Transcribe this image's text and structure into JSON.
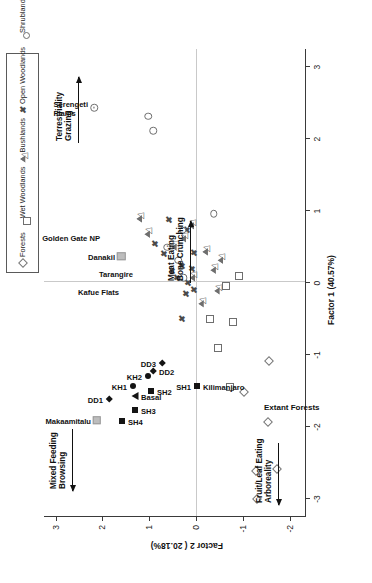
{
  "figure": {
    "type": "scatter-biplot",
    "orientation": "rotated-90"
  },
  "legend": {
    "items": [
      {
        "label": "Forests",
        "marker": "open-diamond"
      },
      {
        "label": "Wet Woodlands",
        "marker": "open-square"
      },
      {
        "label": "Bushlands",
        "marker": "open-triangle"
      },
      {
        "label": "Open Woodlands",
        "marker": "x-cross"
      },
      {
        "label": "Shrublands",
        "marker": "open-circle"
      },
      {
        "label": "Grasslands",
        "marker": "circle-dot"
      },
      {
        "label": "Grass/Forest",
        "marker": "open-triangle"
      },
      {
        "label": "Basal",
        "marker": "filled-triangle"
      },
      {
        "label": "Sidi Hakoma",
        "marker": "filled-square"
      },
      {
        "label": "Denen Dora",
        "marker": "filled-diamond"
      },
      {
        "label": "Kada Hadar",
        "marker": "filled-circle"
      },
      {
        "label": "Other",
        "marker": "grey-square"
      }
    ]
  },
  "axes": {
    "x": {
      "label": "Factor 1 (40.57%)",
      "ticks": [
        -3,
        -2,
        -1,
        0,
        1,
        2,
        3
      ],
      "tick_labels": [
        "-3",
        "-2",
        "-1",
        "0",
        "1",
        "2",
        "3"
      ],
      "min": -3.25,
      "max": 3.25
    },
    "y": {
      "label": "Factor 2 ( 20.18%)",
      "ticks": [
        -2,
        -1,
        0,
        1,
        2,
        3
      ],
      "tick_labels": [
        "-2",
        "-1",
        "0",
        "1",
        "2",
        "3"
      ],
      "min": -2.35,
      "max": 3.25
    }
  },
  "annotations": [
    {
      "name": "terrestriality-grazing",
      "lines": [
        "Terrestriality",
        "Grazing"
      ],
      "arrow": "right"
    },
    {
      "name": "meat-eating-bone-crunching",
      "lines": [
        "Meat Eating",
        "Bone Crunching"
      ],
      "arrow": "right"
    },
    {
      "name": "mixed-feeding-browsing",
      "lines": [
        "Mixed Feeding",
        "Browsing"
      ],
      "arrow": "left"
    },
    {
      "name": "fruit-leaf-eating-arboreality",
      "lines": [
        "Fruit/Leaf Eating",
        "Arboreality"
      ],
      "arrow": "left"
    }
  ],
  "group_labels": [
    {
      "name": "extant-forests",
      "text": "Extant Forests"
    }
  ],
  "chart_data": {
    "type": "scatter",
    "title": "",
    "xlabel": "Factor 1 (40.57%)",
    "ylabel": "Factor 2 ( 20.18%)",
    "xlim": [
      -3.25,
      3.25
    ],
    "ylim": [
      -2.35,
      3.25
    ],
    "grid": false,
    "legend_position": "top-right",
    "series": [
      {
        "name": "Forests",
        "marker": "open-diamond",
        "points": [
          {
            "x": -3.02,
            "y": -1.3
          },
          {
            "x": -2.62,
            "y": -1.28
          },
          {
            "x": -2.6,
            "y": -1.72
          },
          {
            "x": -1.95,
            "y": -1.53
          },
          {
            "x": -1.53,
            "y": -1.02
          },
          {
            "x": -1.1,
            "y": -1.55
          }
        ]
      },
      {
        "name": "Wet Woodlands",
        "marker": "open-square",
        "points": [
          {
            "x": -1.46,
            "y": -0.72
          },
          {
            "x": -0.92,
            "y": -0.46
          },
          {
            "x": -0.52,
            "y": -0.3
          },
          {
            "x": -0.55,
            "y": -0.8
          },
          {
            "x": -0.05,
            "y": -0.63
          },
          {
            "x": 0.08,
            "y": -0.92
          }
        ]
      },
      {
        "name": "Bushlands",
        "marker": "open-triangle",
        "points": [
          {
            "x": -0.3,
            "y": -0.1
          },
          {
            "x": -0.12,
            "y": -0.44
          },
          {
            "x": 0.16,
            "y": -0.36
          },
          {
            "x": 0.3,
            "y": -0.52
          },
          {
            "x": 0.42,
            "y": -0.19
          },
          {
            "x": 0.6,
            "y": 0.27
          },
          {
            "x": 0.78,
            "y": 0.1
          },
          {
            "x": 0.48,
            "y": 0.48
          },
          {
            "x": 0.06,
            "y": 0.08
          }
        ]
      },
      {
        "name": "Open Woodlands",
        "marker": "x-cross",
        "points": [
          {
            "x": -0.52,
            "y": 0.3
          },
          {
            "x": -0.18,
            "y": 0.22
          },
          {
            "x": -0.02,
            "y": 0.18
          },
          {
            "x": 0.05,
            "y": 0.4
          },
          {
            "x": 0.14,
            "y": 0.52
          },
          {
            "x": 0.22,
            "y": 0.3
          },
          {
            "x": 0.38,
            "y": 0.68
          },
          {
            "x": 0.4,
            "y": 0.05
          },
          {
            "x": 0.52,
            "y": 0.88
          },
          {
            "x": 0.72,
            "y": 0.2
          },
          {
            "x": 0.86,
            "y": 0.58
          },
          {
            "x": 0.18,
            "y": 0.08
          },
          {
            "x": -0.12,
            "y": 0.05
          }
        ]
      },
      {
        "name": "Shrublands",
        "marker": "open-circle",
        "points": [
          {
            "x": 0.06,
            "y": 0.26
          },
          {
            "x": 0.3,
            "y": 0.38
          },
          {
            "x": 0.48,
            "y": 0.62
          },
          {
            "x": 0.72,
            "y": 0.28
          },
          {
            "x": 0.95,
            "y": -0.38
          },
          {
            "x": 2.1,
            "y": 0.92
          },
          {
            "x": 2.3,
            "y": 1.02
          }
        ]
      },
      {
        "name": "Grasslands",
        "marker": "circle-dot",
        "points": [
          {
            "x": 2.42,
            "y": 2.18
          }
        ]
      },
      {
        "name": "Grass/Forest",
        "marker": "open-triangle",
        "points": [
          {
            "x": 0.88,
            "y": 1.22
          },
          {
            "x": 0.66,
            "y": 1.05
          }
        ]
      },
      {
        "name": "Basal",
        "marker": "filled-triangle",
        "points": [
          {
            "x": -1.58,
            "y": 1.3
          }
        ]
      },
      {
        "name": "Sidi Hakoma",
        "marker": "filled-square",
        "points": [
          {
            "x": -1.93,
            "y": 1.58
          },
          {
            "x": -1.78,
            "y": 1.31
          },
          {
            "x": -1.52,
            "y": 0.96
          },
          {
            "x": -1.45,
            "y": -0.02
          }
        ]
      },
      {
        "name": "Denen Dora",
        "marker": "filled-diamond",
        "points": [
          {
            "x": -1.62,
            "y": 1.86
          },
          {
            "x": -1.24,
            "y": 0.92
          },
          {
            "x": -1.12,
            "y": 0.72
          }
        ]
      },
      {
        "name": "Kada Hadar",
        "marker": "filled-circle",
        "points": [
          {
            "x": -1.44,
            "y": 1.34
          },
          {
            "x": -1.3,
            "y": 1.02
          }
        ]
      },
      {
        "name": "Other",
        "marker": "grey-square",
        "points": [
          {
            "x": -1.92,
            "y": 2.12
          },
          {
            "x": 0.36,
            "y": 1.6
          }
        ]
      }
    ],
    "point_labels": [
      {
        "text": "SH4",
        "x": -1.93,
        "y": 1.58,
        "anchor": "left",
        "bold": true
      },
      {
        "text": "DD1",
        "x": -1.62,
        "y": 1.86,
        "anchor": "right",
        "bold": true
      },
      {
        "text": "Makaamitalu",
        "x": -1.92,
        "y": 2.12,
        "anchor": "right",
        "bold": true
      },
      {
        "text": "SH3",
        "x": -1.78,
        "y": 1.31,
        "anchor": "left",
        "bold": true
      },
      {
        "text": "Basal",
        "x": -1.58,
        "y": 1.3,
        "anchor": "left",
        "bold": true
      },
      {
        "text": "KH1",
        "x": -1.44,
        "y": 1.34,
        "anchor": "right",
        "bold": true
      },
      {
        "text": "SH2",
        "x": -1.52,
        "y": 0.96,
        "anchor": "left",
        "bold": true
      },
      {
        "text": "DD2",
        "x": -1.24,
        "y": 0.92,
        "anchor": "left",
        "bold": true
      },
      {
        "text": "KH2",
        "x": -1.3,
        "y": 1.02,
        "anchor": "right",
        "bold": true
      },
      {
        "text": "DD3",
        "x": -1.12,
        "y": 0.72,
        "anchor": "right",
        "bold": true
      },
      {
        "text": "SH1",
        "x": -1.45,
        "y": -0.02,
        "anchor": "right",
        "bold": true
      },
      {
        "text": "Kilimanjaro",
        "x": -1.45,
        "y": -0.02,
        "anchor": "left",
        "bold": true
      },
      {
        "text": "Kafue Flats",
        "x": -0.12,
        "y": 1.52,
        "anchor": "right",
        "bold": true
      },
      {
        "text": "Tarangire",
        "x": 0.12,
        "y": 1.22,
        "anchor": "right",
        "bold": true
      },
      {
        "text": "Danakil",
        "x": 0.36,
        "y": 1.6,
        "anchor": "right",
        "bold": true
      },
      {
        "text": "Golden Gate NP",
        "x": 0.62,
        "y": 1.92,
        "anchor": "right",
        "bold": true
      },
      {
        "text": "Serengeti\nPlains",
        "x": 2.42,
        "y": 2.18,
        "anchor": "right",
        "bold": true
      }
    ]
  }
}
